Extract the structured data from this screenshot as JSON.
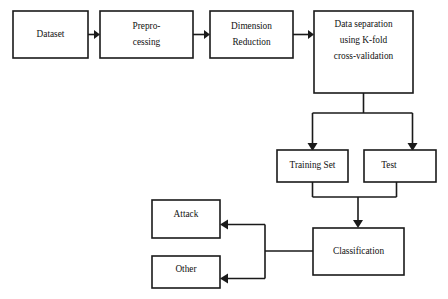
{
  "diagram": {
    "colors": {
      "background": "#ffffff",
      "stroke": "#1a1a1a",
      "box_fill": "#ffffff",
      "text": "#111111"
    },
    "nodes": [
      {
        "id": "dataset",
        "name": "dataset-box",
        "lines": [
          "Dataset"
        ],
        "x": 13,
        "y": 11,
        "w": 75,
        "h": 47
      },
      {
        "id": "preprocessing",
        "name": "preprocessing-box",
        "lines": [
          "Prepro-",
          "cessing"
        ],
        "x": 100,
        "y": 11,
        "w": 93,
        "h": 47
      },
      {
        "id": "dimension_reduction",
        "name": "dimension-reduction-box",
        "lines": [
          "Dimension",
          "Reduction"
        ],
        "x": 210,
        "y": 11,
        "w": 83,
        "h": 47
      },
      {
        "id": "data_separation",
        "name": "data-separation-box",
        "lines": [
          "Data separation",
          "using K-fold",
          "cross-validation"
        ],
        "x": 314,
        "y": 11,
        "w": 99,
        "h": 82
      },
      {
        "id": "training_set",
        "name": "training-set-box",
        "lines": [
          "Training Set"
        ],
        "x": 277,
        "y": 150,
        "w": 71,
        "h": 32
      },
      {
        "id": "test",
        "name": "test-box",
        "lines": [
          "Test"
        ],
        "x": 364,
        "y": 150,
        "w": 72,
        "h": 32
      },
      {
        "id": "classification",
        "name": "classification-box",
        "lines": [
          "Classification"
        ],
        "x": 313,
        "y": 228,
        "w": 91,
        "h": 47
      },
      {
        "id": "attack",
        "name": "attack-box",
        "lines": [
          "Attack"
        ],
        "x": 152,
        "y": 200,
        "w": 68,
        "h": 38
      },
      {
        "id": "other",
        "name": "other-box",
        "lines": [
          "Other"
        ],
        "x": 152,
        "y": 256,
        "w": 68,
        "h": 32
      }
    ],
    "edges": [
      {
        "id": "e1",
        "name": "edge-dataset-to-preprocessing",
        "from": "dataset",
        "to": "preprocessing"
      },
      {
        "id": "e2",
        "name": "edge-preprocessing-to-dimension-reduction",
        "from": "preprocessing",
        "to": "dimension_reduction"
      },
      {
        "id": "e3",
        "name": "edge-dimension-reduction-to-data-separation",
        "from": "dimension_reduction",
        "to": "data_separation"
      },
      {
        "id": "e4",
        "name": "edge-data-separation-to-training-set",
        "from": "data_separation",
        "to": "training_set"
      },
      {
        "id": "e5",
        "name": "edge-data-separation-to-test",
        "from": "data_separation",
        "to": "test"
      },
      {
        "id": "e6",
        "name": "edge-training-and-test-to-classification",
        "from": "training_set,test",
        "to": "classification"
      },
      {
        "id": "e7",
        "name": "edge-classification-to-attack",
        "from": "classification",
        "to": "attack"
      },
      {
        "id": "e8",
        "name": "edge-classification-to-other",
        "from": "classification",
        "to": "other"
      }
    ]
  }
}
